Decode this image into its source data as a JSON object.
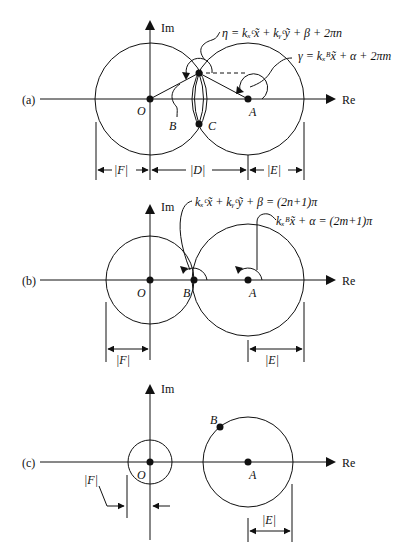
{
  "panels": [
    {
      "label": "(a)",
      "axes": {
        "x": "Re",
        "y": "Im"
      },
      "points": {
        "origin": "O",
        "center": "A",
        "upper": "B",
        "lower": "C"
      },
      "annotations": {
        "eta": "η = kₓᶜx̃ + kᵧᶜỹ + β + 2πn",
        "gamma": "γ = kₓᴮx̃ + α + 2πm"
      },
      "dimensions": [
        "|F|",
        "|D|",
        "|E|"
      ]
    },
    {
      "label": "(b)",
      "axes": {
        "x": "Re",
        "y": "Im"
      },
      "points": {
        "origin": "O",
        "touch": "B",
        "center": "A"
      },
      "annotations": {
        "eta": "kₓᶜx̃ + kᵧᶜỹ + β = (2n+1)π",
        "gamma": "kₓᴮx̃ + α = (2m+1)π"
      },
      "dimensions": [
        "|F|",
        "|E|"
      ]
    },
    {
      "label": "(c)",
      "axes": {
        "x": "Re",
        "y": "Im"
      },
      "points": {
        "origin": "O",
        "center": "A",
        "onCircle": "B"
      },
      "dimensions": [
        "|F|",
        "|E|"
      ]
    }
  ]
}
